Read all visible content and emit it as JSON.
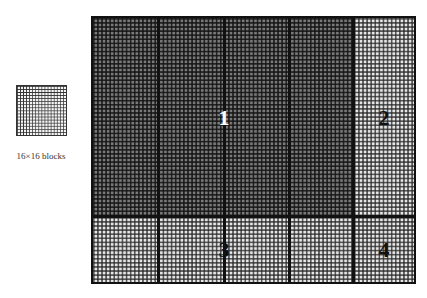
{
  "sample_block": {
    "caption": "16×16 blocks",
    "grid": "16x16"
  },
  "frame": {
    "regions": [
      {
        "id": "1",
        "label": "1",
        "shade": "dark",
        "label_color": "#ffffff"
      },
      {
        "id": "2",
        "label": "2",
        "shade": "light",
        "label_color": "#111111"
      },
      {
        "id": "3",
        "label": "3",
        "shade": "light",
        "label_color": "#111111"
      },
      {
        "id": "4",
        "label": "4",
        "shade": "light",
        "label_color": "#111111"
      }
    ]
  },
  "colors": {
    "dark_region": "#7a7a7a",
    "light_region": "#e6e6e6",
    "border": "#111111"
  }
}
